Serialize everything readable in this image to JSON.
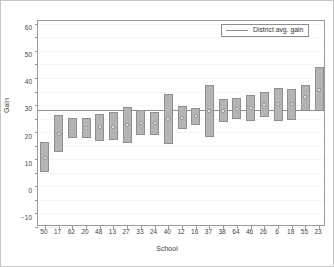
{
  "chart_data": {
    "type": "bar",
    "title": "",
    "xlabel": "School",
    "ylabel": "Gain",
    "ylim": [
      -13,
      63
    ],
    "yticks": [
      -10,
      0,
      10,
      20,
      30,
      40,
      50,
      60
    ],
    "ytick_labels": [
      "−10",
      "0",
      "10",
      "20",
      "30",
      "40",
      "50",
      "60"
    ],
    "grid": true,
    "legend": {
      "position": "top-right",
      "entries": [
        {
          "label": "District avg. gain",
          "type": "line",
          "color": "#8c8c8c"
        }
      ]
    },
    "reference_line": {
      "name": "District avg. gain",
      "value": 30,
      "color": "#8c8c8c"
    },
    "categories": [
      "50",
      "17",
      "62",
      "20",
      "48",
      "13",
      "27",
      "33",
      "24",
      "40",
      "12",
      "16",
      "37",
      "38",
      "64",
      "46",
      "26",
      "6",
      "18",
      "55",
      "23"
    ],
    "series": [
      {
        "name": "Estimated gain",
        "marker": "open-circle",
        "values": [
          12.6,
          21.5,
          23.6,
          23.7,
          23.8,
          24.0,
          24.7,
          25.3,
          25.3,
          26.9,
          27.3,
          27.8,
          29.8,
          29.9,
          30.4,
          30.8,
          32.2,
          32.3,
          32.4,
          34.8,
          37.7
        ]
      },
      {
        "name": "Interval lower bound",
        "values": [
          7.2,
          14.7,
          19.9,
          20.0,
          18.9,
          19.2,
          17.9,
          20.9,
          21.0,
          17.5,
          23.2,
          24.5,
          20.2,
          25.6,
          26.9,
          26.0,
          27.5,
          26.3,
          26.4,
          29.8,
          29.8
        ]
      },
      {
        "name": "Interval upper bound",
        "values": [
          18.3,
          28.5,
          27.3,
          27.2,
          28.7,
          29.5,
          31.2,
          30.1,
          29.6,
          36.2,
          31.7,
          31.1,
          39.4,
          34.2,
          34.6,
          35.8,
          36.9,
          38.3,
          38.1,
          39.4,
          45.9
        ]
      }
    ],
    "bar_color": "#b4b4b4",
    "bar_edge_color": "#8f8f8f",
    "marker_fill": "#ffffff"
  }
}
